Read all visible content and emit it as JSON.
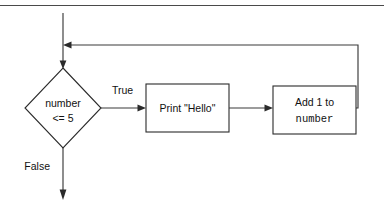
{
  "diagram": {
    "type": "flowchart",
    "background_color": "#ffffff",
    "line_color": "#2b2b2b",
    "text_color": "#111111",
    "top_rule": {
      "visible": true,
      "label": "horizontal-rule"
    },
    "nodes": [
      {
        "id": "entry",
        "shape": "line",
        "name": "entry-arrow",
        "label": ""
      },
      {
        "id": "decision",
        "shape": "diamond",
        "name": "decision-node",
        "line1": "number",
        "line2": "<= 5",
        "line1_font": "sans",
        "line2_font": "sans"
      },
      {
        "id": "print",
        "shape": "rectangle",
        "name": "process-print",
        "line1": "Print \"Hello\"",
        "line2": "",
        "line1_font": "sans",
        "line2_font": "sans"
      },
      {
        "id": "increment",
        "shape": "rectangle",
        "name": "process-increment",
        "line1": "Add 1 to",
        "line2": "number",
        "line1_font": "sans",
        "line2_font": "mono"
      }
    ],
    "edges": [
      {
        "id": "edge-true",
        "name": "edge-true",
        "label": "True",
        "from": "decision",
        "to": "print"
      },
      {
        "id": "edge-false",
        "name": "edge-false",
        "label": "False",
        "from": "decision",
        "to": "exit"
      },
      {
        "id": "edge-print-increment",
        "name": "edge-print-to-increment",
        "label": "",
        "from": "print",
        "to": "increment"
      },
      {
        "id": "edge-loopback",
        "name": "edge-loop-back",
        "label": "",
        "from": "increment",
        "to": "decision"
      }
    ]
  }
}
